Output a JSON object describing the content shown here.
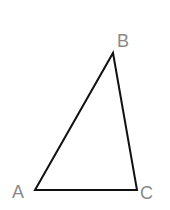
{
  "figure": {
    "type": "triangle",
    "stroke_color": "#111111",
    "label_color": "#8a8a8a",
    "vertices": [
      {
        "name": "A",
        "label": "A",
        "x": 35,
        "y": 190,
        "label_x": 12,
        "label_y": 198
      },
      {
        "name": "B",
        "label": "B",
        "x": 113,
        "y": 53,
        "label_x": 117,
        "label_y": 47
      },
      {
        "name": "C",
        "label": "C",
        "x": 137,
        "y": 190,
        "label_x": 140,
        "label_y": 199
      }
    ]
  }
}
